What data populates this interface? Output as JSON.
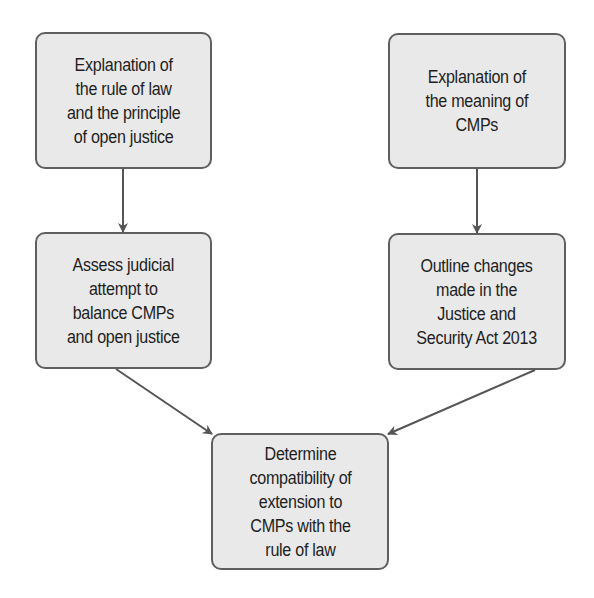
{
  "diagram": {
    "type": "flowchart",
    "nodes": [
      {
        "id": "rule-of-law",
        "lines": [
          "Explanation of",
          "the rule of law",
          "and the principle",
          "of open justice"
        ]
      },
      {
        "id": "meaning-cmps",
        "lines": [
          "Explanation of",
          "the meaning of",
          "CMPs"
        ]
      },
      {
        "id": "judicial-balance",
        "lines": [
          "Assess judicial",
          "attempt to",
          "balance CMPs",
          "and open justice"
        ]
      },
      {
        "id": "jsa-2013",
        "lines": [
          "Outline changes",
          "made in the",
          "Justice and",
          "Security Act 2013"
        ]
      },
      {
        "id": "compatibility",
        "lines": [
          "Determine",
          "compatibility of",
          "extension to",
          "CMPs with the",
          "rule of law"
        ]
      }
    ],
    "edges": [
      {
        "from": "rule-of-law",
        "to": "judicial-balance"
      },
      {
        "from": "meaning-cmps",
        "to": "jsa-2013"
      },
      {
        "from": "judicial-balance",
        "to": "compatibility"
      },
      {
        "from": "jsa-2013",
        "to": "compatibility"
      }
    ],
    "colors": {
      "box_fill": "#e9e9e9",
      "box_border": "#5f5f5f",
      "arrow": "#555555",
      "text": "#1e1e1e"
    }
  }
}
